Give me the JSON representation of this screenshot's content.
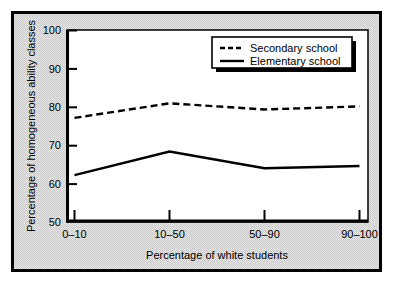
{
  "figure": {
    "background_color": "#c9c9c9",
    "plot_background_color": "#ffffff",
    "frame_color": "#000000"
  },
  "chart_data": {
    "type": "line",
    "title": "",
    "xlabel": "Percentage of white students",
    "ylabel": "Percentage of homogeneous ability classes",
    "categories": [
      "0–10",
      "10–50",
      "50–90",
      "90–100"
    ],
    "ylim": [
      50,
      100
    ],
    "yticks": [
      50,
      60,
      70,
      80,
      90,
      100
    ],
    "ytick_labels": [
      "50",
      "60",
      "70",
      "80",
      "90",
      "100"
    ],
    "grid": false,
    "legend_position": "top right",
    "series": [
      {
        "name": "Secondary school",
        "style": "dashed",
        "color": "#000000",
        "values": [
          77.0,
          80.8,
          79.2,
          80.0
        ]
      },
      {
        "name": "Elementary school",
        "style": "solid",
        "color": "#000000",
        "values": [
          62.0,
          68.2,
          63.8,
          64.4
        ]
      }
    ]
  },
  "legend": {
    "items": [
      {
        "label": "Secondary school",
        "style": "dashed"
      },
      {
        "label": "Elementary school",
        "style": "solid"
      }
    ]
  }
}
